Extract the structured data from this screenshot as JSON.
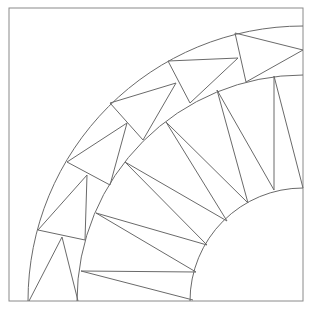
{
  "diagram": {
    "type": "quilt-block-pattern",
    "stroke_color": "#6a6a6a",
    "background": "#ffffff",
    "frame": {
      "x1": 9,
      "y1": 8,
      "x2": 303,
      "y2": 301
    },
    "center": {
      "x": 303,
      "y": 301
    },
    "arcs": {
      "outer_radius": 275,
      "middle_radius": 226,
      "inner_radius": 113
    },
    "outer_ring_lines": [
      [
        303,
        50,
        235,
        33
      ],
      [
        235,
        33,
        246,
        82
      ],
      [
        246,
        82,
        303,
        50
      ],
      [
        238,
        58,
        168,
        61
      ],
      [
        168,
        61,
        190,
        103
      ],
      [
        190,
        103,
        238,
        58
      ],
      [
        176,
        83,
        110,
        103
      ],
      [
        110,
        103,
        143,
        140
      ],
      [
        143,
        140,
        176,
        83
      ],
      [
        127,
        123,
        67,
        162
      ],
      [
        67,
        162,
        110,
        185
      ],
      [
        110,
        185,
        127,
        123
      ],
      [
        87,
        175,
        38,
        230
      ],
      [
        38,
        230,
        85,
        240
      ],
      [
        85,
        240,
        87,
        175
      ],
      [
        62,
        237,
        29,
        301
      ],
      [
        62,
        237,
        78,
        301
      ]
    ],
    "inner_ring_lines": [
      [
        274,
        76,
        274,
        190
      ],
      [
        274,
        76,
        303,
        188
      ],
      [
        217,
        90,
        248,
        203
      ],
      [
        217,
        90,
        274,
        190
      ],
      [
        166,
        122,
        227,
        221
      ],
      [
        166,
        122,
        248,
        203
      ],
      [
        125,
        162,
        207,
        245
      ],
      [
        125,
        162,
        227,
        221
      ],
      [
        96,
        213,
        196,
        272
      ],
      [
        96,
        213,
        207,
        245
      ],
      [
        81,
        271,
        193,
        300
      ],
      [
        81,
        271,
        196,
        272
      ]
    ]
  }
}
